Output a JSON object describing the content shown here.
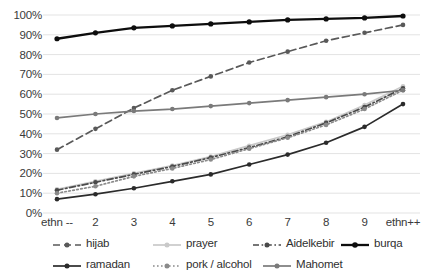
{
  "chart_data": {
    "type": "line",
    "title": "",
    "xlabel": "",
    "ylabel": "",
    "grid": true,
    "legend_position": "bottom",
    "ylim": [
      0,
      100
    ],
    "ytick_labels": [
      "0%",
      "10%",
      "20%",
      "30%",
      "40%",
      "50%",
      "60%",
      "70%",
      "80%",
      "90%",
      "100%"
    ],
    "ytick_values": [
      0,
      10,
      20,
      30,
      40,
      50,
      60,
      70,
      80,
      90,
      100
    ],
    "categories": [
      "ethn --",
      "2",
      "3",
      "4",
      "5",
      "6",
      "7",
      "8",
      "9",
      "ethn++"
    ],
    "series": [
      {
        "name": "hijab",
        "color": "#595959",
        "style": "dashed",
        "values": [
          32,
          42.5,
          53,
          62,
          69,
          76,
          81.5,
          87,
          91,
          95
        ]
      },
      {
        "name": "prayer",
        "color": "#c9c9c9",
        "style": "solid",
        "values": [
          12,
          16,
          20,
          24,
          28.5,
          34,
          39.5,
          46,
          54.5,
          64
        ]
      },
      {
        "name": "Aidelkebir",
        "color": "#4a4a4a",
        "style": "dashdot",
        "values": [
          11.5,
          15.5,
          19.5,
          23.5,
          28,
          33,
          38.5,
          45.5,
          53.5,
          63
        ]
      },
      {
        "name": "burqa",
        "color": "#0d0d0d",
        "style": "solid",
        "values": [
          88,
          91,
          93.5,
          94.5,
          95.5,
          96.5,
          97.5,
          98,
          98.5,
          99.5
        ]
      },
      {
        "name": "ramadan",
        "color": "#2b2b2b",
        "style": "solid",
        "values": [
          7,
          9.5,
          12.5,
          16,
          19.5,
          24.5,
          29.5,
          35.5,
          43.5,
          55
        ]
      },
      {
        "name": "pork / alcohol",
        "color": "#8a8a8a",
        "style": "dotted",
        "values": [
          10,
          13.5,
          18.5,
          22.5,
          27,
          32.5,
          38,
          44.5,
          52.5,
          62
        ]
      },
      {
        "name": "Mahomet",
        "color": "#7a7a7a",
        "style": "solid",
        "values": [
          48,
          50,
          51.5,
          52.5,
          54,
          55.5,
          57,
          58.5,
          60,
          62
        ]
      }
    ]
  },
  "legend": {
    "rows": [
      [
        "hijab",
        "prayer",
        "Aidelkebir",
        "burqa"
      ],
      [
        "ramadan",
        "pork / alcohol",
        "Mahomet"
      ]
    ]
  },
  "colors": {
    "grid": "#e3e3e3",
    "axis_text": "#3a3a3a",
    "background": "#ffffff"
  }
}
